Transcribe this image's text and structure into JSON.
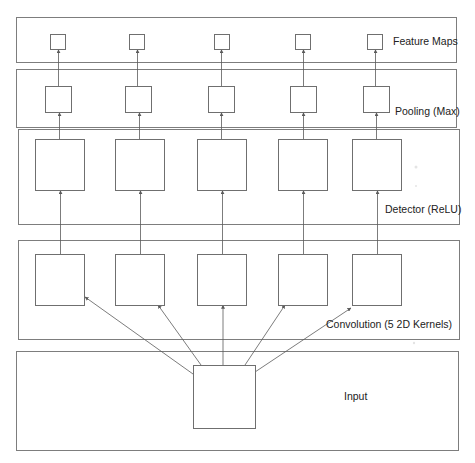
{
  "diagram": {
    "colors": {
      "panel_border": "#7d7d7d",
      "node_border": "#6f6f6f",
      "edge": "#5a5a5a",
      "text": "#222222",
      "background": "#ffffff"
    },
    "panels": [
      {
        "id": "feature-maps",
        "label": "Feature Maps",
        "x": 16,
        "y": 17,
        "w": 440,
        "h": 45,
        "label_x": 393,
        "label_y": 45
      },
      {
        "id": "pooling",
        "label": "Pooling (Max)",
        "x": 16,
        "y": 69,
        "w": 440,
        "h": 58,
        "label_x": 395,
        "label_y": 115
      },
      {
        "id": "detector",
        "label": "Detector (ReLU)",
        "x": 18,
        "y": 129,
        "w": 441,
        "h": 95,
        "label_x": 385,
        "label_y": 213
      },
      {
        "id": "convolution",
        "label": "Convolution (5 2D Kernels)",
        "x": 18,
        "y": 240,
        "w": 441,
        "h": 99,
        "label_x": 326,
        "label_y": 328
      },
      {
        "id": "input",
        "label": "Input",
        "x": 16,
        "y": 351,
        "w": 442,
        "h": 99,
        "label_x": 344,
        "label_y": 400
      }
    ],
    "columns_x": [
      58,
      138,
      222,
      302,
      376
    ],
    "nodes": {
      "feature_maps": {
        "size": 15,
        "y": 34,
        "x": [
          50,
          129,
          214,
          295,
          367
        ]
      },
      "pooling": {
        "size": 26,
        "y": 86,
        "x": [
          45,
          125,
          208,
          290,
          363
        ]
      },
      "detector": {
        "w": 49,
        "h": 51,
        "y": 139,
        "x": [
          35,
          115,
          197,
          278,
          352
        ]
      },
      "convolution": {
        "w": 49,
        "h": 51,
        "y": 254,
        "x": [
          35,
          115,
          197,
          278,
          352
        ]
      },
      "input": {
        "x": 193,
        "y": 365,
        "w": 62,
        "h": 63
      }
    },
    "edges": {
      "input_to_conv": [
        {
          "x1": 193,
          "y1": 374,
          "x2": 85,
          "y2": 297
        },
        {
          "x1": 201,
          "y1": 365,
          "x2": 158,
          "y2": 305
        },
        {
          "x1": 223,
          "y1": 365,
          "x2": 223,
          "y2": 305
        },
        {
          "x1": 245,
          "y1": 365,
          "x2": 285,
          "y2": 305
        },
        {
          "x1": 255,
          "y1": 372,
          "x2": 351,
          "y2": 308
        }
      ]
    }
  }
}
